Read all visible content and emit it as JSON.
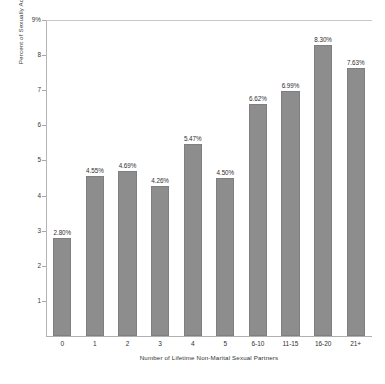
{
  "chart_data": {
    "type": "bar",
    "title": "",
    "xlabel": "Number of Lifetime Non-Marital Sexual Partners",
    "ylabel": "Percent of Sexually Active Women Aged 15-44",
    "categories": [
      "0",
      "1",
      "2",
      "3",
      "4",
      "5",
      "6-10",
      "11-15",
      "16-20",
      "21+"
    ],
    "values": [
      2.8,
      4.55,
      4.69,
      4.26,
      5.47,
      4.5,
      6.62,
      6.99,
      8.3,
      7.63
    ],
    "data_labels": [
      "2.80%",
      "4.55%",
      "4.69%",
      "4.26%",
      "5.47%",
      "4.50%",
      "6.62%",
      "6.99%",
      "8.30%",
      "7.63%"
    ],
    "ylim": [
      0,
      9
    ],
    "ytick_values": [
      9,
      8,
      7,
      6,
      5,
      4,
      3,
      2,
      1
    ],
    "ytick_labels": [
      "9%",
      "8",
      "7",
      "6",
      "5",
      "4",
      "3",
      "2",
      "1"
    ],
    "grid": false,
    "legend": null,
    "bar_color": "#8d8d8d",
    "bar_edge_color": "#7f7f7f",
    "axis_color": "#b0b0b0",
    "background_color": "#ffffff"
  }
}
